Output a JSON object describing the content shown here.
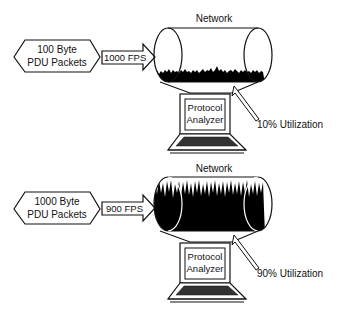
{
  "diagram": {
    "scenarios": [
      {
        "network_label": "Network",
        "source_line1": "100 Byte",
        "source_line2": "PDU Packets",
        "rate_label": "1000 FPS",
        "analyzer_line1": "Protocol",
        "analyzer_line2": "Analyzer",
        "utilization_label": "10% Utilization",
        "utilization_percent": 10
      },
      {
        "network_label": "Network",
        "source_line1": "1000 Byte",
        "source_line2": "PDU Packets",
        "rate_label": "900 FPS",
        "analyzer_line1": "Protocol",
        "analyzer_line2": "Analyzer",
        "utilization_label": "90% Utilization",
        "utilization_percent": 90
      }
    ]
  },
  "colors": {
    "line": "#111111",
    "fill": "#000000",
    "background": "#ffffff"
  }
}
